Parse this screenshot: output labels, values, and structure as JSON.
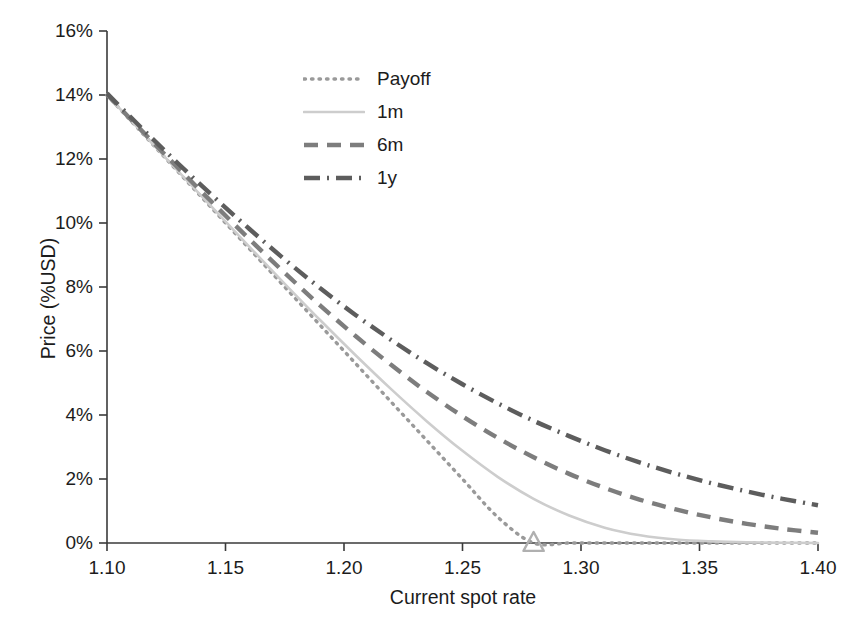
{
  "chart_data": {
    "type": "line",
    "title": "",
    "xlabel": "Current spot rate",
    "ylabel": "Price (%USD)",
    "xlim": [
      1.1,
      1.4
    ],
    "ylim": [
      0,
      16
    ],
    "grid": false,
    "legend_position": "upper-center",
    "xticks": [
      "1.10",
      "1.15",
      "1.20",
      "1.25",
      "1.30",
      "1.35",
      "1.40"
    ],
    "xtick_values": [
      1.1,
      1.15,
      1.2,
      1.25,
      1.3,
      1.35,
      1.4
    ],
    "yticks": [
      "0%",
      "2%",
      "4%",
      "6%",
      "8%",
      "10%",
      "12%",
      "14%",
      "16%"
    ],
    "ytick_values": [
      0,
      2,
      4,
      6,
      8,
      10,
      12,
      14,
      16
    ],
    "x": [
      1.1,
      1.115,
      1.13,
      1.145,
      1.16,
      1.175,
      1.19,
      1.205,
      1.22,
      1.235,
      1.25,
      1.265,
      1.28,
      1.295,
      1.31,
      1.325,
      1.34,
      1.355,
      1.37,
      1.385,
      1.4
    ],
    "series": [
      {
        "name": "Payoff",
        "style": "dotted",
        "color": "#9a9a9a",
        "values": [
          14.0,
          12.8,
          11.6,
          10.4,
          9.2,
          8.0,
          6.8,
          5.6,
          4.4,
          3.2,
          2.0,
          0.8,
          0.0,
          0.0,
          0.0,
          0.0,
          0.0,
          0.0,
          0.0,
          0.0,
          0.0
        ]
      },
      {
        "name": "1m",
        "style": "solid",
        "color": "#cdcdcd",
        "values": [
          14.0,
          12.81,
          11.62,
          10.44,
          9.26,
          8.1,
          6.96,
          5.86,
          4.8,
          3.8,
          2.88,
          2.06,
          1.38,
          0.86,
          0.48,
          0.24,
          0.11,
          0.05,
          0.02,
          0.01,
          0.0
        ]
      },
      {
        "name": "6m",
        "style": "dashed",
        "color": "#7d7d7d",
        "values": [
          14.02,
          12.86,
          11.72,
          10.6,
          9.5,
          8.44,
          7.42,
          6.46,
          5.56,
          4.72,
          3.96,
          3.28,
          2.68,
          2.16,
          1.72,
          1.35,
          1.05,
          0.8,
          0.6,
          0.44,
          0.32
        ]
      },
      {
        "name": "1y",
        "style": "dashdot",
        "color": "#5d5d5d",
        "values": [
          14.05,
          12.94,
          11.86,
          10.82,
          9.82,
          8.86,
          7.96,
          7.12,
          6.34,
          5.62,
          4.96,
          4.36,
          3.82,
          3.34,
          2.9,
          2.51,
          2.17,
          1.87,
          1.61,
          1.38,
          1.18
        ]
      }
    ],
    "markers": [
      {
        "name": "strike-marker",
        "shape": "triangle",
        "x": 1.28,
        "y": 0.0,
        "color": "#b0b0b0"
      }
    ]
  },
  "axes": {
    "y_title": "Price (%USD)",
    "x_title": "Current spot rate"
  },
  "legend": {
    "entries": [
      {
        "label": "Payoff"
      },
      {
        "label": "1m"
      },
      {
        "label": "6m"
      },
      {
        "label": "1y"
      }
    ]
  }
}
